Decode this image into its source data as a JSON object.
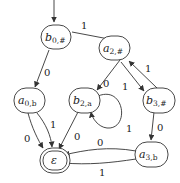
{
  "diagram": {
    "type": "finite-automaton",
    "initial_state": "b0",
    "states": [
      {
        "id": "b0",
        "base": "b",
        "sub": "0,#",
        "x": 62,
        "y": 38,
        "accepting": false
      },
      {
        "id": "a2",
        "base": "a",
        "sub": "2,#",
        "x": 132,
        "y": 48,
        "accepting": false
      },
      {
        "id": "a0",
        "base": "a",
        "sub": "0,b",
        "x": 35,
        "y": 100,
        "accepting": false
      },
      {
        "id": "b2",
        "base": "b",
        "sub": "2,a",
        "x": 83,
        "y": 100,
        "accepting": false
      },
      {
        "id": "b3",
        "base": "b",
        "sub": "3,#",
        "x": 149,
        "y": 100,
        "accepting": false
      },
      {
        "id": "eps",
        "base": "ε",
        "sub": "",
        "x": 47,
        "y": 160,
        "accepting": true
      },
      {
        "id": "a3",
        "base": "a",
        "sub": "3,b",
        "x": 137,
        "y": 153,
        "accepting": false
      }
    ],
    "edges": [
      {
        "from": "b0",
        "to": "a2",
        "label": "1"
      },
      {
        "from": "b0",
        "to": "a0",
        "label": "0"
      },
      {
        "from": "a2",
        "to": "b2",
        "label": "0"
      },
      {
        "from": "a2",
        "to": "b3",
        "label": "1"
      },
      {
        "from": "b3",
        "to": "a2",
        "label": "1"
      },
      {
        "from": "b2",
        "to": "b2",
        "label": "1"
      },
      {
        "from": "a0",
        "to": "eps",
        "label": "0"
      },
      {
        "from": "a0",
        "to": "eps",
        "label": "1"
      },
      {
        "from": "b2",
        "to": "eps",
        "label": "0"
      },
      {
        "from": "b3",
        "to": "a3",
        "label": "0"
      },
      {
        "from": "a3",
        "to": "eps",
        "label": "0"
      },
      {
        "from": "a3",
        "to": "eps",
        "label": "1"
      }
    ]
  },
  "labels": {
    "b0": {
      "base": "b",
      "sub": "0,#"
    },
    "a2": {
      "base": "a",
      "sub": "2,#"
    },
    "a0": {
      "base": "a",
      "sub": "0,b"
    },
    "b2": {
      "base": "b",
      "sub": "2,a"
    },
    "b3": {
      "base": "b",
      "sub": "3,#"
    },
    "a3": {
      "base": "a",
      "sub": "3,b"
    },
    "eps": {
      "base": "ε"
    }
  },
  "edge_labels": {
    "b0_a2": "1",
    "b0_a0": "0",
    "a2_b2": "0",
    "a2_b3": "1",
    "b3_a2": "1",
    "b2_loop": "1",
    "a0_eps_0": "0",
    "a0_eps_1": "1",
    "b2_eps": "0",
    "b3_a3": "0",
    "a3_eps_0": "0",
    "a3_eps_1": "1"
  }
}
